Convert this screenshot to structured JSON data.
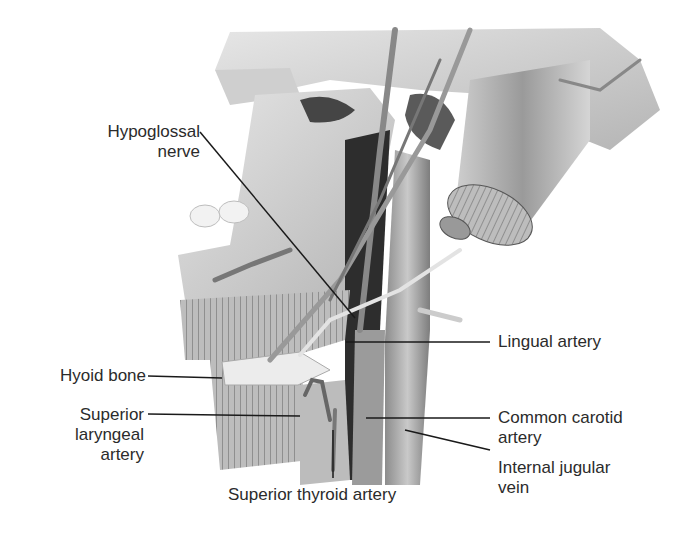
{
  "figure": {
    "labels": {
      "hypoglossal_nerve": [
        "Hypoglossal",
        "nerve"
      ],
      "hyoid_bone": "Hyoid bone",
      "superior_laryngeal_artery": [
        "Superior",
        "laryngeal",
        "artery"
      ],
      "superior_thyroid_artery": "Superior thyroid artery",
      "lingual_artery": "Lingual artery",
      "common_carotid_artery": [
        "Common carotid",
        "artery"
      ],
      "internal_jugular_vein": [
        "Internal jugular",
        "vein"
      ]
    },
    "colors": {
      "background": "#ffffff",
      "text": "#2b2b2b",
      "leader_line": "#1a1a1a",
      "tissue_light": "#d9d9d9",
      "tissue_mid": "#a8a8a8",
      "tissue_dark": "#3a3a3a"
    }
  }
}
